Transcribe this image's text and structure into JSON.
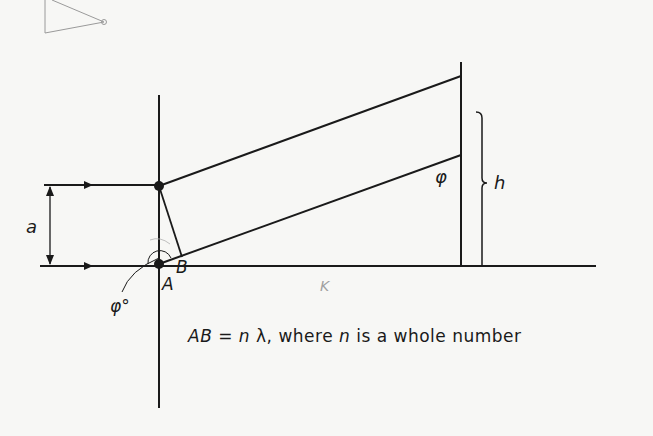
{
  "diagram": {
    "type": "Bragg-like diffraction geometry",
    "labels": {
      "spacing": "a",
      "point_a": "A",
      "point_b": "B",
      "angle_screen": "φ",
      "angle_origin": "φ°",
      "height": "h",
      "pencil_mark": "K"
    },
    "caption": {
      "lhs": "AB",
      "equals": " = ",
      "n1": "n",
      "lambda": " λ",
      "mid": ", where ",
      "n2": "n",
      "rest": " is a whole number"
    },
    "colors": {
      "ink": "#1a1a1a",
      "pencil": "#9a9a9a",
      "background": "#f7f7f5"
    }
  }
}
